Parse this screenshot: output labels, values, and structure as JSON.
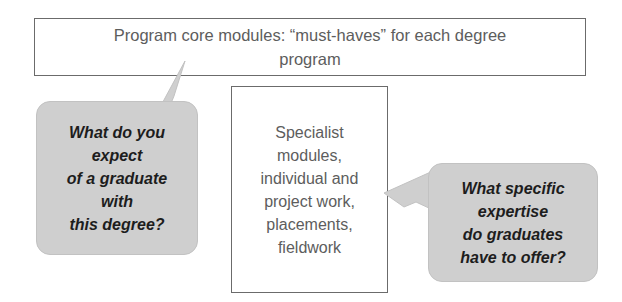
{
  "diagram": {
    "background_color": "#ffffff",
    "boxes": [
      {
        "name": "top-box",
        "text": "Program core modules: “must-haves” for each degree\nprogram",
        "border_color": "#6b6b6b",
        "fill_color": "#ffffff",
        "text_color": "#5d5d5d"
      },
      {
        "name": "center-box",
        "text": "Specialist\nmodules,\nindividual and\nproject work,\nplacements,\nfieldwork",
        "border_color": "#6b6b6b",
        "fill_color": "#ffffff",
        "text_color": "#5d5d5d"
      }
    ],
    "bubbles": [
      {
        "name": "bubble-left",
        "text": "What do you\nexpect\nof a graduate\nwith\nthis degree?",
        "fill_color": "#cfcfcf",
        "text_color": "#1d1d1d",
        "points_to": "top-box"
      },
      {
        "name": "bubble-right",
        "text": "What specific\nexpertise\ndo graduates\nhave to offer?",
        "fill_color": "#cfcfcf",
        "text_color": "#1d1d1d",
        "points_to": "center-box"
      }
    ]
  }
}
